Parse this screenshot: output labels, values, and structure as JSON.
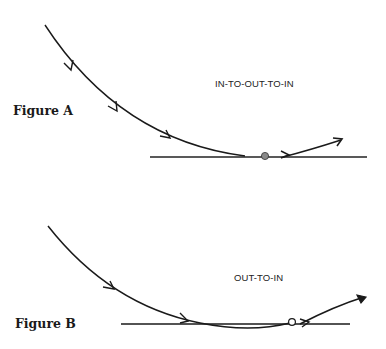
{
  "figures": [
    {
      "id": "A",
      "label": "Figure A",
      "path_label": "IN-TO-OUT-TO-IN"
    },
    {
      "id": "B",
      "label": "Figure B",
      "path_label": "OUT-TO-IN"
    }
  ],
  "colors": {
    "ink": "#1a1a1a",
    "ball": "#8a8a8a",
    "background": "#ffffff"
  }
}
